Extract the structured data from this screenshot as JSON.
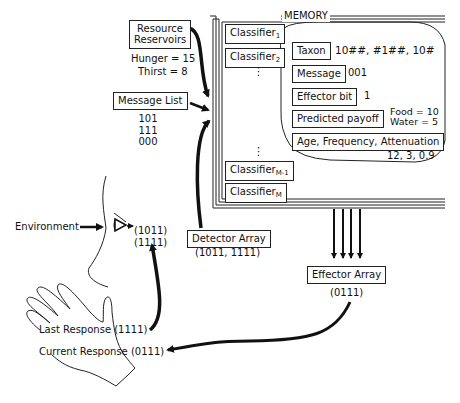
{
  "memory": {
    "title": "MEMORY",
    "classifiers": [
      {
        "base": "Classifier",
        "sub": "1"
      },
      {
        "base": "Classifier",
        "sub": "2"
      },
      {
        "base": "Classifier",
        "sub": "M-1"
      },
      {
        "base": "Classifier",
        "sub": "M"
      }
    ],
    "ellipsis": "⋮",
    "detail": {
      "taxon_label": "Taxon",
      "taxon_value": "10##, #1##, 10#",
      "message_label": "Message",
      "message_value": "001",
      "effector_label": "Effector bit",
      "effector_value": "1",
      "payoff_label": "Predicted payoff",
      "payoff_food": "Food = 10",
      "payoff_water": "Water = 5",
      "afa_label": "Age, Frequency, Attenuation",
      "afa_value": "12, 3, 0.9"
    }
  },
  "resource_reservoirs": {
    "label_line1": "Resource",
    "label_line2": "Reservoirs",
    "hunger": "Hunger = 15",
    "thirst": "Thirst = 8"
  },
  "message_list": {
    "label": "Message List",
    "messages": [
      "101",
      "111",
      "000"
    ]
  },
  "environment": {
    "label": "Environment"
  },
  "sensor": {
    "input1": "(1011)",
    "input2": "(1111)"
  },
  "detector_array": {
    "label": "Detector Array",
    "value": "(1011, 1111)"
  },
  "effector_array": {
    "label": "Effector Array",
    "value": "(0111)"
  },
  "hand": {
    "last_response": "Last Response (1111)",
    "current_response": "Current Response (0111)"
  }
}
